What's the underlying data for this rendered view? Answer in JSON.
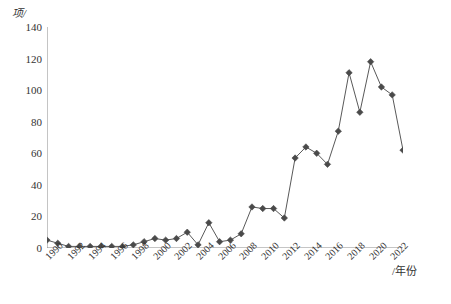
{
  "chart_data": {
    "type": "line",
    "title": "",
    "xlabel": "/年份",
    "ylabel": "项/",
    "x": [
      1990,
      1991,
      1992,
      1993,
      1994,
      1995,
      1996,
      1997,
      1998,
      1999,
      2000,
      2001,
      2002,
      2003,
      2004,
      2005,
      2006,
      2007,
      2008,
      2009,
      2010,
      2011,
      2012,
      2013,
      2014,
      2015,
      2016,
      2017,
      2018,
      2019,
      2020,
      2021,
      2022,
      2023
    ],
    "values": [
      5,
      3,
      1,
      1,
      1,
      1,
      1,
      1,
      2,
      4,
      6,
      5,
      6,
      10,
      2,
      16,
      4,
      5,
      9,
      26,
      25,
      25,
      19,
      57,
      64,
      60,
      53,
      74,
      111,
      86,
      118,
      102,
      97,
      62
    ],
    "series": [
      {
        "name": "项目数",
        "values": [
          5,
          3,
          1,
          1,
          1,
          1,
          1,
          1,
          2,
          4,
          6,
          5,
          6,
          10,
          2,
          16,
          4,
          5,
          9,
          26,
          25,
          25,
          19,
          57,
          64,
          60,
          53,
          74,
          111,
          86,
          118,
          102,
          97,
          62
        ]
      }
    ],
    "xtick_labels": [
      "1990",
      "1992",
      "1994",
      "1996",
      "1998",
      "2000",
      "2002",
      "2004",
      "2006",
      "2008",
      "2010",
      "2012",
      "2014",
      "2016",
      "2018",
      "2020",
      "2022"
    ],
    "xtick_values": [
      1990,
      1992,
      1994,
      1996,
      1998,
      2000,
      2002,
      2004,
      2006,
      2008,
      2010,
      2012,
      2014,
      2016,
      2018,
      2020,
      2022
    ],
    "ytick_labels": [
      "0",
      "20",
      "40",
      "60",
      "80",
      "100",
      "120",
      "140"
    ],
    "ytick_values": [
      0,
      20,
      40,
      60,
      80,
      100,
      120,
      140
    ],
    "ylim": [
      0,
      140
    ],
    "xlim": [
      1990,
      2023
    ],
    "grid": false,
    "legend": false,
    "marker": "diamond",
    "line_color": "#595959",
    "marker_color": "#4a4a4a"
  },
  "axis": {
    "y_unit_label": "项/",
    "x_unit_label": "/年份"
  },
  "caption": {
    "text": ""
  }
}
